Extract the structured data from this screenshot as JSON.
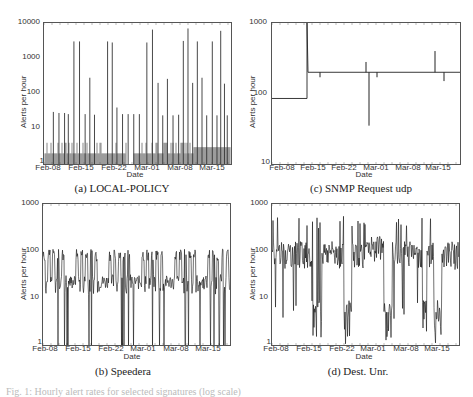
{
  "figure": {
    "partial_caption_text": "Fig. 1: Hourly alert rates for selected signatures (log scale)"
  },
  "panels": {
    "a": {
      "caption": "(a) LOCAL-POLICY",
      "ylabel": "Alerts per hour",
      "xlabel": "Date",
      "yticks": [
        "10000",
        "1000",
        "100",
        "10",
        "1"
      ],
      "xticks": [
        "Feb-08",
        "Feb-15",
        "Feb-22",
        "Mar-01",
        "Mar-08",
        "Mar-15"
      ]
    },
    "c": {
      "caption": "(c) SNMP Request udp",
      "ylabel": "Alerts per hour",
      "xlabel": "Date",
      "yticks": [
        "1000",
        "100",
        "10"
      ],
      "xticks": [
        "Feb-08",
        "Feb-15",
        "Feb-22",
        "Mar-01",
        "Mar-08",
        "Mar-15"
      ]
    },
    "b": {
      "caption": "(b) Speedera",
      "ylabel": "Alerts per hour",
      "xlabel": "Date",
      "yticks": [
        "1000",
        "100",
        "10",
        "1"
      ],
      "xticks": [
        "Feb-08",
        "Feb-15",
        "Feb-22",
        "Mar-01",
        "Mar-08",
        "Mar-15"
      ]
    },
    "d": {
      "caption": "(d) Dest. Unr.",
      "ylabel": "Alerts per hour",
      "xlabel": "Date",
      "yticks": [
        "1000",
        "100",
        "10",
        "1"
      ],
      "xticks": [
        "Feb-08",
        "Feb-15",
        "Feb-22",
        "Mar-01",
        "Mar-08",
        "Mar-15"
      ]
    }
  },
  "chart_data": [
    {
      "type": "line",
      "title": "(a) LOCAL-POLICY",
      "xlabel": "Date",
      "ylabel": "Alerts per hour",
      "yscale": "log",
      "ylim": [
        1,
        10000
      ],
      "xticks": [
        "Feb-08",
        "Feb-15",
        "Feb-22",
        "Mar-01",
        "Mar-08",
        "Mar-15"
      ],
      "description": "Baseline ~2-4 alerts/hour with periodic spikes to ~25-30 and large spikes to ~3000-7000",
      "spikes": [
        {
          "x_frac": 0.05,
          "value": 30
        },
        {
          "x_frac": 0.08,
          "value": 28
        },
        {
          "x_frac": 0.11,
          "value": 28
        },
        {
          "x_frac": 0.13,
          "value": 26
        },
        {
          "x_frac": 0.16,
          "value": 3000
        },
        {
          "x_frac": 0.19,
          "value": 3000
        },
        {
          "x_frac": 0.22,
          "value": 26
        },
        {
          "x_frac": 0.245,
          "value": 280
        },
        {
          "x_frac": 0.27,
          "value": 25
        },
        {
          "x_frac": 0.34,
          "value": 3000
        },
        {
          "x_frac": 0.365,
          "value": 2800
        },
        {
          "x_frac": 0.39,
          "value": 40
        },
        {
          "x_frac": 0.42,
          "value": 26
        },
        {
          "x_frac": 0.45,
          "value": 26
        },
        {
          "x_frac": 0.48,
          "value": 26
        },
        {
          "x_frac": 0.51,
          "value": 26
        },
        {
          "x_frac": 0.55,
          "value": 2800
        },
        {
          "x_frac": 0.58,
          "value": 6500
        },
        {
          "x_frac": 0.61,
          "value": 200
        },
        {
          "x_frac": 0.635,
          "value": 24
        },
        {
          "x_frac": 0.66,
          "value": 260
        },
        {
          "x_frac": 0.69,
          "value": 24
        },
        {
          "x_frac": 0.72,
          "value": 25
        },
        {
          "x_frac": 0.745,
          "value": 3100
        },
        {
          "x_frac": 0.77,
          "value": 7000
        },
        {
          "x_frac": 0.795,
          "value": 200
        },
        {
          "x_frac": 0.82,
          "value": 3000
        },
        {
          "x_frac": 0.845,
          "value": 280
        },
        {
          "x_frac": 0.87,
          "value": 24
        },
        {
          "x_frac": 0.9,
          "value": 3000
        },
        {
          "x_frac": 0.925,
          "value": 24
        },
        {
          "x_frac": 0.945,
          "value": 6000
        },
        {
          "x_frac": 0.965,
          "value": 190
        },
        {
          "x_frac": 0.98,
          "value": 24
        }
      ]
    },
    {
      "type": "line",
      "title": "(c) SNMP Request udp",
      "xlabel": "Date",
      "ylabel": "Alerts per hour",
      "yscale": "log",
      "ylim": [
        10,
        1000
      ],
      "xticks": [
        "Feb-08",
        "Feb-15",
        "Feb-22",
        "Mar-01",
        "Mar-08",
        "Mar-15"
      ],
      "segments": [
        {
          "from": "Feb-08",
          "to": "Feb-15",
          "value": 85
        },
        {
          "at": "Feb-15",
          "spike": 1000
        },
        {
          "from": "Feb-15",
          "to": "end",
          "value": 200
        }
      ],
      "anomalies": [
        {
          "near": "Feb-16",
          "value": 170
        },
        {
          "near": "Feb-27",
          "value": 280
        },
        {
          "near": "Feb-28",
          "value": 35
        },
        {
          "near": "Mar-01",
          "value": 170
        },
        {
          "near": "Mar-14",
          "value": 400
        },
        {
          "near": "Mar-16",
          "value": 150
        }
      ]
    },
    {
      "type": "line",
      "title": "(b) Speedera",
      "xlabel": "Date",
      "ylabel": "Alerts per hour",
      "yscale": "log",
      "ylim": [
        1,
        1000
      ],
      "xticks": [
        "Feb-08",
        "Feb-15",
        "Feb-22",
        "Mar-01",
        "Mar-08",
        "Mar-15"
      ],
      "description": "Strong daily cycle: weekday peaks ~80-120 alerts/hour, troughs ~10-30; frequent drops to 1; weekends lower (~20)"
    },
    {
      "type": "line",
      "title": "(d) Dest. Unr.",
      "xlabel": "Date",
      "ylabel": "Alerts per hour",
      "yscale": "log",
      "ylim": [
        1,
        1000
      ],
      "xticks": [
        "Feb-08",
        "Feb-15",
        "Feb-22",
        "Mar-01",
        "Mar-08",
        "Mar-15"
      ],
      "description": "Noisy ~30-200 alerts/hour with peaks up to ~500; deep drops near Feb-15, Feb-22, Mar-01, Mar-08, Mar-15"
    }
  ]
}
